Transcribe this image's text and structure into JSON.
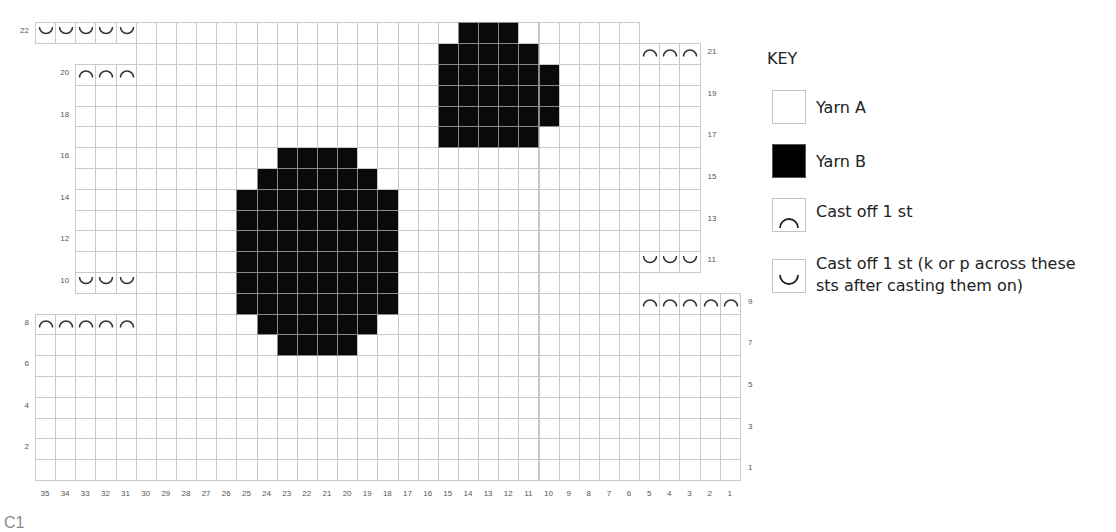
{
  "chart_data": {
    "type": "heatmap",
    "xlabel": "Stitch",
    "ylabel": "Row",
    "columns": [
      35,
      34,
      33,
      32,
      31,
      30,
      29,
      28,
      27,
      26,
      25,
      24,
      23,
      22,
      21,
      20,
      19,
      18,
      17,
      16,
      15,
      14,
      13,
      12,
      11,
      10,
      9,
      8,
      7,
      6,
      5,
      4,
      3,
      2,
      1
    ],
    "rows": [
      1,
      2,
      3,
      4,
      5,
      6,
      7,
      8,
      9,
      10,
      11,
      12,
      13,
      14,
      15,
      16,
      17,
      18,
      19,
      20,
      21,
      22
    ],
    "row_labels_left": [
      2,
      4,
      6,
      8,
      10,
      12,
      14,
      16,
      18,
      20,
      22
    ],
    "row_labels_right": [
      1,
      3,
      5,
      7,
      9,
      11,
      13,
      15,
      17,
      19,
      21
    ],
    "row_extents": {
      "1": [
        35,
        1
      ],
      "2": [
        35,
        1
      ],
      "3": [
        35,
        1
      ],
      "4": [
        35,
        1
      ],
      "5": [
        35,
        1
      ],
      "6": [
        35,
        1
      ],
      "7": [
        35,
        1
      ],
      "8": [
        35,
        1
      ],
      "9": [
        30,
        1
      ],
      "10": [
        33,
        6
      ],
      "11": [
        33,
        3
      ],
      "12": [
        33,
        3
      ],
      "13": [
        33,
        3
      ],
      "14": [
        33,
        3
      ],
      "15": [
        33,
        3
      ],
      "16": [
        33,
        3
      ],
      "17": [
        33,
        3
      ],
      "18": [
        33,
        3
      ],
      "19": [
        33,
        3
      ],
      "20": [
        33,
        3
      ],
      "21": [
        30,
        3
      ],
      "22": [
        35,
        6
      ]
    },
    "yarn_b_cells": {
      "7": [
        23,
        20
      ],
      "8": [
        24,
        19
      ],
      "9": [
        25,
        18
      ],
      "10": [
        25,
        18
      ],
      "11": [
        25,
        18
      ],
      "12": [
        25,
        18
      ],
      "13": [
        25,
        18
      ],
      "14": [
        25,
        18
      ],
      "15": [
        24,
        19
      ],
      "16": [
        23,
        20
      ],
      "17": [
        15,
        11
      ],
      "18": [
        15,
        10
      ],
      "19": [
        15,
        10
      ],
      "20": [
        15,
        10
      ],
      "21": [
        15,
        11
      ],
      "22": [
        14,
        12
      ]
    },
    "cast_off_cap": [
      {
        "row": 8,
        "cols": [
          35,
          34,
          33,
          32,
          31
        ]
      },
      {
        "row": 9,
        "cols": [
          5,
          4,
          3,
          2,
          1
        ]
      },
      {
        "row": 20,
        "cols": [
          33,
          32,
          31
        ]
      },
      {
        "row": 21,
        "cols": [
          5,
          4,
          3
        ]
      }
    ],
    "cast_off_cup": [
      {
        "row": 10,
        "cols": [
          33,
          32,
          31
        ]
      },
      {
        "row": 11,
        "cols": [
          5,
          4,
          3
        ]
      },
      {
        "row": 22,
        "cols": [
          35,
          34,
          33,
          32,
          31
        ]
      }
    ],
    "colors": {
      "yarn_a": "#ffffff",
      "yarn_b": "#000000",
      "grid": "#c9c9c9"
    }
  },
  "footer_cut_text": "C1",
  "key": {
    "title": "KEY",
    "items": [
      {
        "label": "Yarn A",
        "symbol": "empty"
      },
      {
        "label": "Yarn B",
        "symbol": "filled"
      },
      {
        "label": "Cast off 1 st",
        "symbol": "cap"
      },
      {
        "label_line1": "Cast off 1 st (k or p across these",
        "label_line2": "sts after casting them on)",
        "symbol": "cup"
      }
    ]
  }
}
